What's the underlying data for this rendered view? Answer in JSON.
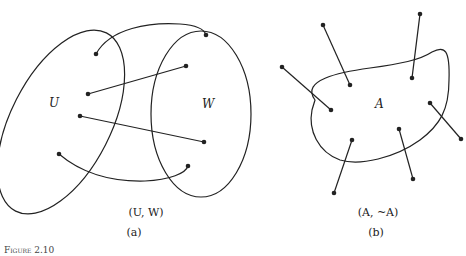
{
  "figure": {
    "caption": "Figure 2.10",
    "panels": [
      {
        "id": "a",
        "set_labels": [
          "U",
          "W"
        ],
        "expression": "(U, W)",
        "tag": "(a)",
        "description": "Two overlapping sets U and W with four edges joining points of U to points of W"
      },
      {
        "id": "b",
        "set_labels": [
          "A"
        ],
        "expression": "(A, ~A)",
        "tag": "(b)",
        "description": "Set A with seven edges each joining a point inside A to a point outside A"
      }
    ]
  }
}
